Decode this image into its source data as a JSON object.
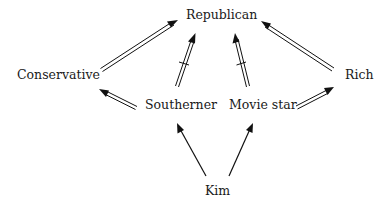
{
  "diagram": {
    "nodes": {
      "republican": "Republican",
      "conservative": "Conservative",
      "rich": "Rich",
      "southerner": "Southerner",
      "movie_star": "Movie star",
      "kim": "Kim"
    },
    "edges": [
      {
        "from": "Conservative",
        "to": "Republican",
        "style": "double",
        "negated": false
      },
      {
        "from": "Southerner",
        "to": "Republican",
        "style": "double",
        "negated": true
      },
      {
        "from": "Movie star",
        "to": "Republican",
        "style": "double",
        "negated": true
      },
      {
        "from": "Rich",
        "to": "Republican",
        "style": "double",
        "negated": false
      },
      {
        "from": "Southerner",
        "to": "Conservative",
        "style": "double",
        "negated": false
      },
      {
        "from": "Movie star",
        "to": "Rich",
        "style": "double",
        "negated": false
      },
      {
        "from": "Kim",
        "to": "Southerner",
        "style": "single",
        "negated": false
      },
      {
        "from": "Kim",
        "to": "Movie star",
        "style": "single",
        "negated": false
      }
    ],
    "colors": {
      "stroke": "#111111",
      "text": "#1a1a1a",
      "background": "#ffffff"
    }
  }
}
